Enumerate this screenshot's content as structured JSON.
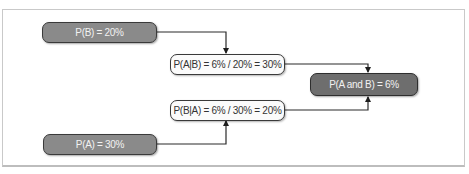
{
  "diagram": {
    "type": "flowchart",
    "nodes": [
      {
        "id": "p_b",
        "label": "P(B) = 20%",
        "style": "dark"
      },
      {
        "id": "p_a_given_b",
        "label": "P(A|B) = 6% / 20% = 30%",
        "style": "light"
      },
      {
        "id": "p_a_and_b",
        "label": "P(A and B) = 6%",
        "style": "darker"
      },
      {
        "id": "p_b_given_a",
        "label": "P(B|A) = 6% / 30% = 20%",
        "style": "light"
      },
      {
        "id": "p_a",
        "label": "P(A) = 30%",
        "style": "dark"
      }
    ],
    "edges": [
      {
        "from": "p_b",
        "to": "p_a_given_b"
      },
      {
        "from": "p_a_given_b",
        "to": "p_a_and_b"
      },
      {
        "from": "p_b_given_a",
        "to": "p_a_and_b"
      },
      {
        "from": "p_a",
        "to": "p_b_given_a"
      }
    ],
    "colors": {
      "dark_node_fill": "#8a8a8a",
      "darker_node_fill": "#6e6e6e",
      "light_node_fill": "#fbfbfb",
      "stroke": "#2e2e2e"
    }
  }
}
